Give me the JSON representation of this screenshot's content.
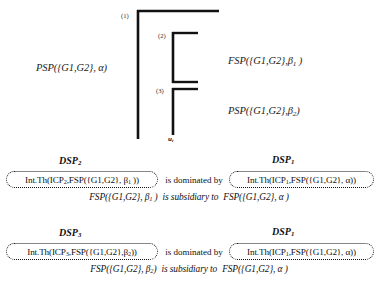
{
  "diagram": {
    "markers": [
      {
        "id": "1",
        "label": "(1)"
      },
      {
        "id": "2",
        "label": "(2)"
      },
      {
        "id": "3",
        "label": "(3)"
      }
    ],
    "labels": {
      "left_process": "PSP({G1,G2}, α)",
      "right_upper": "FSP({G1,G2},β",
      "right_upper_sub": "1",
      "right_upper_tail": " )",
      "right_lower": "PSP({G1,G2},β",
      "right_lower_sub": "2",
      "right_lower_tail": ")",
      "axis_label": "u",
      "axis_label_sub": "t"
    },
    "line_color": "#111111"
  },
  "relations": [
    {
      "left_title": "DSP",
      "left_title_sub": "2",
      "right_title": "DSP",
      "right_title_sub": "1",
      "left_formula_pre": "Int.Th(ICP",
      "left_formula_sub1": "2",
      "left_formula_mid": ",FSP({G1,G2}, β",
      "left_formula_sub2": "1",
      "left_formula_post": " ))",
      "connector": "is dominated by",
      "right_formula_pre": "Int.Th(ICP",
      "right_formula_sub1": "1",
      "right_formula_mid": ",FSP({G1,G2}, α))",
      "subsidiary_left": "FSP({G1,G2}, β",
      "subsidiary_left_sub": "1",
      "subsidiary_left_tail": " )",
      "subsidiary_mid": "is subsidiary to",
      "subsidiary_right": "FSP({G1,G2}, α )"
    },
    {
      "left_title": "DSP",
      "left_title_sub": "3",
      "right_title": "DSP",
      "right_title_sub": "1",
      "left_formula_pre": "Int.Th(ICP",
      "left_formula_sub1": "3",
      "left_formula_mid": ",FSP({G1,G2},β",
      "left_formula_sub2": "2",
      "left_formula_post": "))",
      "connector": "is dominated by",
      "right_formula_pre": "Int.Th(ICP",
      "right_formula_sub1": "1",
      "right_formula_mid": ",FSP({G1,G2}, α))",
      "subsidiary_left": "FSP({G1,G2}, β",
      "subsidiary_left_sub": "2",
      "subsidiary_left_tail": ")",
      "subsidiary_mid": "is subsidiary to",
      "subsidiary_right": "FSP({G1,G2}, α )"
    }
  ]
}
